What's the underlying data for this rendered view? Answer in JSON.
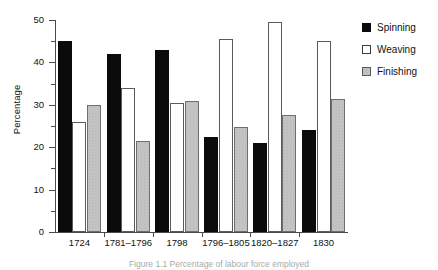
{
  "chart_data": {
    "type": "bar",
    "title": "",
    "xlabel": "",
    "ylabel": "Percentage",
    "ylim": [
      0,
      50
    ],
    "ytick_values": [
      0,
      10,
      20,
      30,
      40,
      50
    ],
    "ytick_labels": [
      "0",
      "10",
      "20",
      "30",
      "40",
      "50"
    ],
    "yminor_tick_values": [
      5,
      15,
      25,
      35,
      45
    ],
    "grid": false,
    "legend_position": "right",
    "categories": [
      "1724",
      "1781–1796",
      "1798",
      "1796–1805",
      "1820–1827",
      "1830"
    ],
    "series": [
      {
        "name": "Spinning",
        "color": "#0b0b0b",
        "values": [
          45.0,
          42.0,
          43.0,
          22.5,
          21.0,
          24.0
        ]
      },
      {
        "name": "Weaving",
        "color": "#ffffff",
        "values": [
          26.0,
          34.0,
          30.5,
          45.5,
          49.5,
          45.0
        ]
      },
      {
        "name": "Finishing",
        "color": "#c6c6c6",
        "values": [
          30.0,
          21.5,
          31.0,
          24.8,
          27.5,
          31.3
        ]
      }
    ]
  },
  "legend": {
    "items": [
      {
        "label": "Spinning",
        "swatch": "black-filled-square"
      },
      {
        "label": "Weaving",
        "swatch": "white-outlined-square"
      },
      {
        "label": "Finishing",
        "swatch": "gray-stippled-square"
      }
    ]
  },
  "caption": {
    "text": "Figure 1.1 Percentage of labour  force  employed"
  }
}
